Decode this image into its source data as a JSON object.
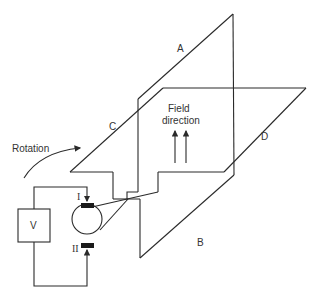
{
  "diagram": {
    "labels": {
      "side_a": "A",
      "side_b": "B",
      "side_c": "C",
      "side_d": "D",
      "field": "Field",
      "field_direction": "direction",
      "rotation": "Rotation",
      "voltmeter": "V",
      "brush_1": "I",
      "brush_2": "II"
    },
    "colors": {
      "stroke": "#2a2a2a",
      "text": "#333333",
      "background": "#ffffff",
      "brush": "#1a1a1a"
    }
  }
}
